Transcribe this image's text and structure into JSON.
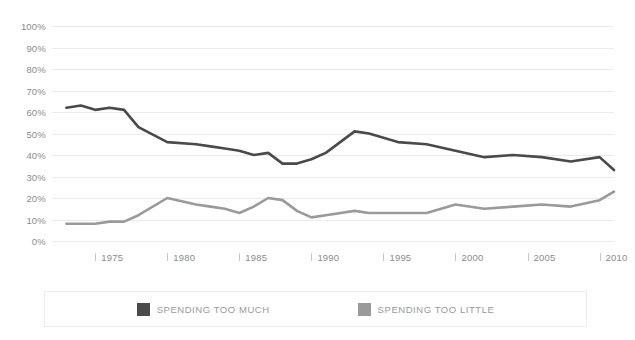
{
  "chart_data": {
    "type": "line",
    "title": "",
    "xlabel": "",
    "ylabel": "",
    "xlim": [
      1972,
      2011
    ],
    "ylim": [
      0,
      100
    ],
    "grid": true,
    "legend_position": "bottom",
    "y_ticks": [
      "0%",
      "10%",
      "20%",
      "30%",
      "40%",
      "50%",
      "60%",
      "70%",
      "80%",
      "90%",
      "100%"
    ],
    "y_tick_values": [
      0,
      10,
      20,
      30,
      40,
      50,
      60,
      70,
      80,
      90,
      100
    ],
    "x_ticks": [
      "1975",
      "1980",
      "1985",
      "1990",
      "1995",
      "2000",
      "2005",
      "2010"
    ],
    "x_tick_values": [
      1975,
      1980,
      1985,
      1990,
      1995,
      2000,
      2005,
      2010
    ],
    "x": [
      1973,
      1974,
      1975,
      1976,
      1977,
      1978,
      1980,
      1982,
      1983,
      1984,
      1985,
      1986,
      1987,
      1988,
      1989,
      1990,
      1991,
      1993,
      1994,
      1996,
      1998,
      2000,
      2002,
      2004,
      2006,
      2008,
      2010,
      2011
    ],
    "series": [
      {
        "name": "SPENDING TOO MUCH",
        "color": "#4a4a4a",
        "values": [
          62,
          63,
          61,
          62,
          61,
          53,
          46,
          45,
          44,
          43,
          42,
          40,
          41,
          36,
          36,
          38,
          41,
          51,
          50,
          46,
          45,
          42,
          39,
          40,
          39,
          37,
          39,
          33
        ]
      },
      {
        "name": "SPENDING TOO LITTLE",
        "color": "#9a9a9a",
        "values": [
          8,
          8,
          8,
          9,
          9,
          12,
          20,
          17,
          16,
          15,
          13,
          16,
          20,
          19,
          14,
          11,
          12,
          14,
          13,
          13,
          13,
          17,
          15,
          16,
          17,
          16,
          19,
          23
        ]
      }
    ]
  },
  "legend": {
    "items": [
      {
        "label": "SPENDING TOO MUCH",
        "color": "#4a4a4a",
        "swatch_name": "legend-swatch-spending-too-much"
      },
      {
        "label": "SPENDING TOO LITTLE",
        "color": "#9a9a9a",
        "swatch_name": "legend-swatch-spending-too-little"
      }
    ]
  }
}
